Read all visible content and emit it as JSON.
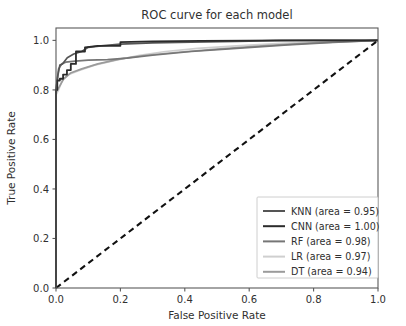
{
  "chart_data": {
    "type": "line",
    "title": "ROC curve for each model",
    "xlabel": "False Positive Rate",
    "ylabel": "True Positive Rate",
    "xlim": [
      0.0,
      1.0
    ],
    "ylim": [
      0.0,
      1.05
    ],
    "grid": false,
    "legend_position": "lower right",
    "xticks": [
      "0.0",
      "0.2",
      "0.4",
      "0.6",
      "0.8",
      "1.0"
    ],
    "xtick_values": [
      0.0,
      0.2,
      0.4,
      0.6,
      0.8,
      1.0
    ],
    "yticks": [
      "0.0",
      "0.2",
      "0.4",
      "0.6",
      "0.8",
      "1.0"
    ],
    "ytick_values": [
      0.0,
      0.2,
      0.4,
      0.6,
      0.8,
      1.0
    ],
    "reference_line": {
      "name": "chance-diagonal",
      "style": "dashed",
      "color": "#111111",
      "x": [
        0.0,
        1.0
      ],
      "y": [
        0.0,
        1.0
      ]
    },
    "series": [
      {
        "name": "KNN",
        "area": "0.95",
        "legend_label": "KNN (area = 0.95)",
        "color": "#555555",
        "width": 1.7,
        "x": [
          0.0,
          0.0,
          0.006,
          0.012,
          0.02,
          0.035,
          0.055,
          0.08,
          0.1,
          0.14,
          0.2,
          0.3,
          0.42,
          0.56,
          0.68,
          0.8,
          1.0
        ],
        "y": [
          0.0,
          0.8,
          0.86,
          0.9,
          0.905,
          0.93,
          0.945,
          0.955,
          0.972,
          0.978,
          0.985,
          0.99,
          0.993,
          0.996,
          0.999,
          1.0,
          1.0
        ]
      },
      {
        "name": "CNN",
        "area": "1.00",
        "legend_label": "CNN (area = 1.00)",
        "color": "#2b2b2b",
        "width": 1.8,
        "x": [
          0.0,
          0.0,
          0.004,
          0.004,
          0.012,
          0.012,
          0.022,
          0.022,
          0.034,
          0.034,
          0.046,
          0.046,
          0.062,
          0.062,
          0.09,
          0.09,
          0.13,
          0.2,
          0.2,
          0.3,
          0.45,
          0.6,
          0.7,
          0.85,
          1.0
        ],
        "y": [
          0.0,
          0.8,
          0.8,
          0.838,
          0.838,
          0.845,
          0.845,
          0.862,
          0.862,
          0.88,
          0.88,
          0.905,
          0.905,
          0.955,
          0.955,
          0.972,
          0.978,
          0.978,
          0.993,
          0.996,
          0.998,
          0.999,
          1.0,
          1.0,
          1.0
        ]
      },
      {
        "name": "RF",
        "area": "0.98",
        "legend_label": "RF (area = 0.98)",
        "color": "#767676",
        "width": 1.7,
        "x": [
          0.0,
          0.0,
          0.008,
          0.018,
          0.03,
          0.06,
          0.1,
          0.16,
          0.22,
          0.3,
          0.42,
          0.56,
          0.72,
          0.86,
          1.0
        ],
        "y": [
          0.0,
          0.8,
          0.885,
          0.905,
          0.912,
          0.916,
          0.92,
          0.922,
          0.928,
          0.94,
          0.955,
          0.968,
          0.982,
          0.992,
          1.0
        ]
      },
      {
        "name": "LR",
        "area": "0.97",
        "legend_label": "LR (area = 0.97)",
        "color": "#cfcfcf",
        "width": 1.7,
        "x": [
          0.0,
          0.0,
          0.008,
          0.02,
          0.04,
          0.07,
          0.12,
          0.18,
          0.26,
          0.34,
          0.44,
          0.56,
          0.7,
          0.85,
          1.0
        ],
        "y": [
          0.0,
          0.78,
          0.8,
          0.84,
          0.862,
          0.878,
          0.9,
          0.918,
          0.94,
          0.955,
          0.968,
          0.978,
          0.988,
          0.995,
          1.0
        ]
      },
      {
        "name": "DT",
        "area": "0.94",
        "legend_label": "DT (area = 0.94)",
        "color": "#9b9b9b",
        "width": 1.7,
        "x": [
          0.0,
          0.0,
          0.01,
          0.024,
          0.045,
          0.08,
          0.13,
          0.2,
          0.28,
          0.38,
          0.5,
          0.64,
          0.8,
          1.0
        ],
        "y": [
          0.0,
          0.79,
          0.812,
          0.845,
          0.868,
          0.885,
          0.905,
          0.925,
          0.94,
          0.952,
          0.965,
          0.978,
          0.99,
          1.0
        ]
      }
    ]
  }
}
